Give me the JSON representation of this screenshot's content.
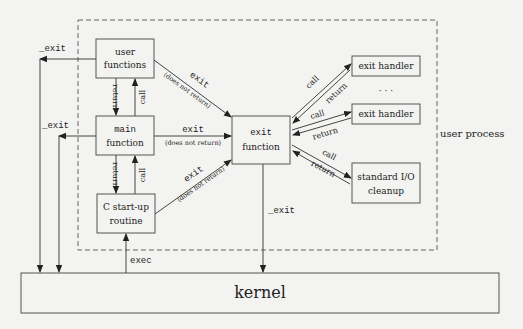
{
  "diagram": {
    "boundary_label": "user process",
    "nodes": {
      "user_functions": {
        "line1": "user",
        "line2": "functions"
      },
      "main_function": {
        "line1": "main",
        "line2": "function"
      },
      "c_startup": {
        "line1": "C start-up",
        "line2": "routine"
      },
      "exit_function": {
        "line1": "exit",
        "line2": "function"
      },
      "exit_handler_1": {
        "label": "exit handler"
      },
      "exit_handler_2": {
        "label": "exit handler"
      },
      "stdio_cleanup": {
        "line1": "standard I/O",
        "line2": "cleanup"
      },
      "kernel": {
        "label": "kernel"
      },
      "ellipsis": "· · ·"
    },
    "edges": {
      "exit_label": "exit",
      "does_not_return": "(does not return)",
      "underscore_exit": "_exit",
      "call": "call",
      "return": "return",
      "exec": "exec"
    }
  }
}
